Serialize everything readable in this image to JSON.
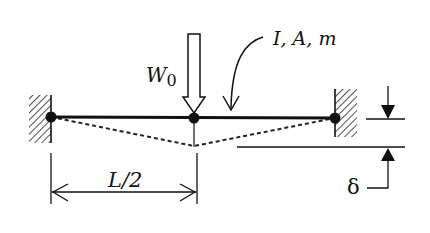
{
  "figure": {
    "type": "beam-diagram",
    "labels": {
      "load": "W",
      "load_subscript": "0",
      "properties": "I, A, m",
      "half_span": "L/2",
      "deflection": "δ"
    },
    "colors": {
      "stroke": "#111111",
      "background": "#ffffff"
    }
  }
}
